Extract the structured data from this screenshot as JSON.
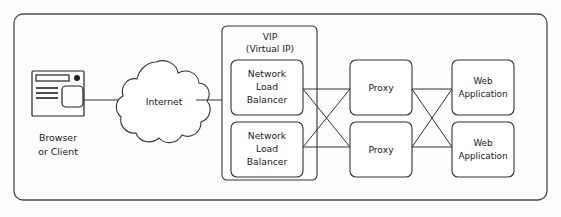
{
  "diagram": {
    "background_color": "#fdfdfd",
    "line_color": "#333333",
    "text_color": "#1a1a1a",
    "outer_boundary": {
      "label": ""
    },
    "client": {
      "icon": "browser-window-icon",
      "label_line1": "Browser",
      "label_line2": "or Client"
    },
    "internet": {
      "icon": "cloud-icon",
      "label": "Internet"
    },
    "vip_group": {
      "label_line1": "VIP",
      "label_line2": "(Virtual IP)",
      "nodes": [
        {
          "id": "nlb-1",
          "line1": "Network",
          "line2": "Load",
          "line3": "Balancer"
        },
        {
          "id": "nlb-2",
          "line1": "Network",
          "line2": "Load",
          "line3": "Balancer"
        }
      ]
    },
    "proxies": [
      {
        "id": "proxy-1",
        "label": "Proxy"
      },
      {
        "id": "proxy-2",
        "label": "Proxy"
      }
    ],
    "web_applications": [
      {
        "id": "webapp-1",
        "line1": "Web",
        "line2": "Application"
      },
      {
        "id": "webapp-2",
        "line1": "Web",
        "line2": "Application"
      }
    ]
  }
}
